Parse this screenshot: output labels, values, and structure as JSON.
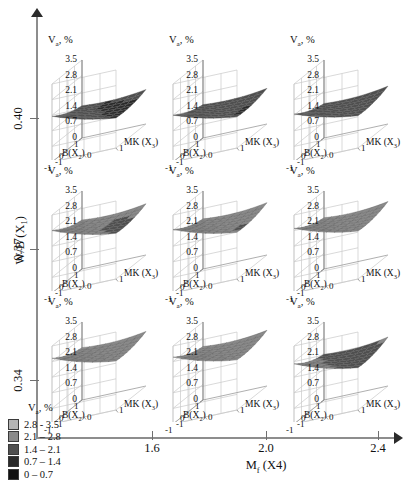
{
  "chart_data": {
    "type": "surface",
    "title": "",
    "response": "Va, %",
    "outer_axes": {
      "ylabel_text": "W/B (X",
      "ylabel_sub": "1",
      "ylabel_tail": ")",
      "yticks": [
        "0.40",
        "0.37",
        "0.34"
      ],
      "xlabel_text": "M",
      "xlabel_sub": "f",
      "xlabel_tail": " (X4)",
      "xticks": [
        "1.6",
        "2.0",
        "2.4"
      ]
    },
    "panel_axes": {
      "ztitle_text": "V",
      "ztitle_sub": "a",
      "ztitle_tail": ", %",
      "zticks": [
        "3.5",
        "2.8",
        "2.1",
        "1.4",
        "0.7",
        "0"
      ],
      "zlim": [
        0,
        3.5
      ],
      "x_name_text": "B(X",
      "x_name_sub": "2",
      "x_name_tail": ")",
      "x_ticks": [
        "1",
        "0",
        "-1"
      ],
      "y_name_text": "MK (X",
      "y_name_sub": "3",
      "y_name_tail": ")",
      "y_ticks": [
        "1",
        "0",
        "-1"
      ],
      "xlim": [
        -1,
        1
      ],
      "ylim": [
        -1,
        1
      ]
    },
    "legend": {
      "title_text": "V",
      "title_sub": "a",
      "title_tail": ", %",
      "position": "bottom-left",
      "bands": [
        {
          "label": "2.8 - 3.5",
          "color": "#b4b4b4",
          "min": 2.8,
          "max": 3.5
        },
        {
          "label": "2.1 – 2.8",
          "color": "#8a8a8a",
          "min": 2.1,
          "max": 2.8
        },
        {
          "label": "1.4 – 2.1",
          "color": "#4f4f4f",
          "min": 1.4,
          "max": 2.1
        },
        {
          "label": "0.7 – 1.4",
          "color": "#2a2a2a",
          "min": 0.7,
          "max": 1.4
        },
        {
          "label": "0 – 0.7",
          "color": "#121212",
          "min": 0.0,
          "max": 0.7
        }
      ]
    },
    "panels": [
      {
        "row": 0,
        "col": 0,
        "wb": "0.40",
        "mf": "1.6",
        "corner_values": {
          "b1_mk1": 1.55,
          "b1_mkm1": 1.45,
          "bm1_mk1": 1.35,
          "bm1_mkm1": 2.05
        },
        "center_value": 1.25
      },
      {
        "row": 0,
        "col": 1,
        "wb": "0.40",
        "mf": "2.0",
        "corner_values": {
          "b1_mk1": 1.6,
          "b1_mkm1": 1.5,
          "bm1_mk1": 1.4,
          "bm1_mkm1": 2.1
        },
        "center_value": 1.3
      },
      {
        "row": 0,
        "col": 2,
        "wb": "0.40",
        "mf": "2.4",
        "corner_values": {
          "b1_mk1": 1.7,
          "b1_mkm1": 1.55,
          "bm1_mk1": 1.45,
          "bm1_mkm1": 2.15
        },
        "center_value": 1.35
      },
      {
        "row": 1,
        "col": 0,
        "wb": "0.37",
        "mf": "1.6",
        "corner_values": {
          "b1_mk1": 2.3,
          "b1_mkm1": 2.2,
          "bm1_mk1": 2.05,
          "bm1_mkm1": 2.8
        },
        "center_value": 1.95
      },
      {
        "row": 1,
        "col": 1,
        "wb": "0.37",
        "mf": "2.0",
        "corner_values": {
          "b1_mk1": 2.35,
          "b1_mkm1": 2.25,
          "bm1_mk1": 2.1,
          "bm1_mkm1": 2.85
        },
        "center_value": 2.0
      },
      {
        "row": 1,
        "col": 2,
        "wb": "0.37",
        "mf": "2.4",
        "corner_values": {
          "b1_mk1": 2.4,
          "b1_mkm1": 2.3,
          "bm1_mk1": 2.15,
          "bm1_mkm1": 2.9
        },
        "center_value": 2.05
      },
      {
        "row": 2,
        "col": 0,
        "wb": "0.34",
        "mf": "1.6",
        "corner_values": {
          "b1_mk1": 2.45,
          "b1_mkm1": 2.35,
          "bm1_mk1": 2.2,
          "bm1_mkm1": 2.95
        },
        "center_value": 2.1
      },
      {
        "row": 2,
        "col": 1,
        "wb": "0.34",
        "mf": "2.0",
        "corner_values": {
          "b1_mk1": 2.5,
          "b1_mkm1": 2.4,
          "bm1_mk1": 2.25,
          "bm1_mkm1": 3.0
        },
        "center_value": 2.15
      },
      {
        "row": 2,
        "col": 2,
        "wb": "0.34",
        "mf": "2.4",
        "corner_values": {
          "b1_mk1": 2.2,
          "b1_mkm1": 2.05,
          "bm1_mk1": 1.9,
          "bm1_mkm1": 2.7
        },
        "center_value": 1.8
      }
    ]
  }
}
